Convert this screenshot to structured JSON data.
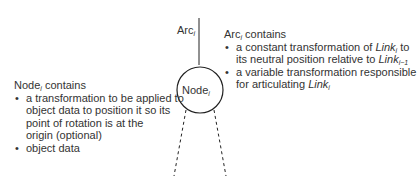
{
  "arc_label": {
    "base": "Arc",
    "sub": "i"
  },
  "node_label": {
    "base": "Node",
    "sub": "i"
  },
  "arc_box": {
    "title": {
      "base": "Arc",
      "sub": "i",
      "suffix": " contains"
    },
    "items": [
      {
        "line1_pre": "a constant transformation of ",
        "line1_link": "Link",
        "line1_sub": "i",
        "line1_post": " to",
        "line2_pre": "its neutral position relative to ",
        "line2_link": "Link",
        "line2_sub": "i−1"
      },
      {
        "line1": "a variable transformation responsible",
        "line2_pre": "for articulating ",
        "line2_link": "Link",
        "line2_sub": "i"
      }
    ]
  },
  "node_box": {
    "title": {
      "base": "Node",
      "sub": "i",
      "suffix": " contains"
    },
    "items": [
      {
        "lines": [
          "a transformation to be applied to",
          "object data to position it so its",
          "point of rotation is at the",
          "origin (optional)"
        ]
      },
      {
        "lines": [
          "object data"
        ]
      }
    ]
  },
  "colors": {
    "line": "#222222",
    "text": "#333333"
  }
}
